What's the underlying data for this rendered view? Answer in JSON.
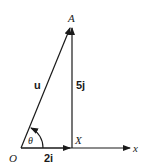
{
  "diagram": {
    "points": {
      "origin": "O",
      "foot": "X",
      "tip": "A"
    },
    "vectors": {
      "resultant": "u",
      "horizontal": "2i",
      "vertical": "5j"
    },
    "angle_label": "θ",
    "axis_label": "x",
    "color": "#1a1a1a"
  }
}
